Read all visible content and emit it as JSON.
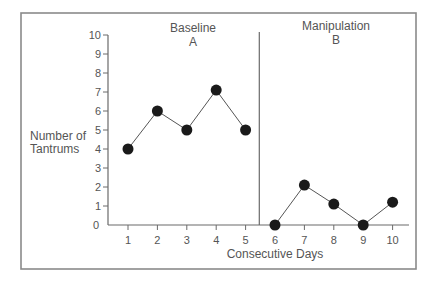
{
  "chart_data": {
    "type": "line",
    "title": "",
    "xlabel": "Consecutive Days",
    "ylabel": "Number of Tantrums",
    "ylabel_lines": [
      "Number of",
      "Tantrums"
    ],
    "ylim": [
      0,
      10
    ],
    "xlim": [
      1,
      10
    ],
    "yticks": [
      0,
      1,
      2,
      3,
      4,
      5,
      6,
      7,
      8,
      9,
      10
    ],
    "xticks": [
      1,
      2,
      3,
      4,
      5,
      6,
      7,
      8,
      9,
      10
    ],
    "grid": false,
    "legend": null,
    "phase_divider_after_x": 5.5,
    "phases": [
      {
        "name": "Baseline",
        "label": "A",
        "x": [
          1,
          2,
          3,
          4,
          5
        ],
        "values": [
          4,
          6,
          5,
          7.1,
          5
        ]
      },
      {
        "name": "Manipulation",
        "label": "B",
        "x": [
          6,
          7,
          8,
          9,
          10
        ],
        "values": [
          0,
          2.1,
          1.1,
          0,
          1.2
        ]
      }
    ]
  },
  "layout": {
    "frame": {
      "x": 21,
      "y": 13,
      "w": 395,
      "h": 256
    },
    "plot": {
      "x0": 108,
      "y0": 225,
      "xEnd": 409,
      "yTop": 35,
      "firstTickX": 128,
      "tickSpacing": 29.4
    }
  }
}
